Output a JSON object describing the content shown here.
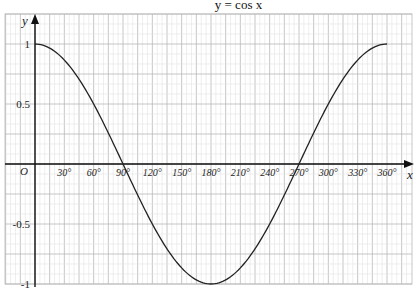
{
  "chart_data": {
    "type": "line",
    "title": "y = cos x",
    "xlabel": "x",
    "ylabel": "y",
    "origin_label": "O",
    "xlim": [
      0,
      360
    ],
    "ylim": [
      -1,
      1
    ],
    "grid": true,
    "x_ticks": [
      30,
      60,
      90,
      120,
      150,
      180,
      210,
      240,
      270,
      300,
      330,
      360
    ],
    "x_tick_labels": [
      "30°",
      "60°",
      "90°",
      "120°",
      "150°",
      "180°",
      "210°",
      "240°",
      "270°",
      "300°",
      "330°",
      "360°"
    ],
    "y_ticks": [
      1,
      0.5,
      -0.5,
      -1
    ],
    "y_tick_labels": [
      "1",
      "0.5",
      "-0.5",
      "-1"
    ],
    "series": [
      {
        "name": "y = cos x",
        "x": [
          0,
          30,
          60,
          90,
          120,
          150,
          180,
          210,
          240,
          270,
          300,
          330,
          360
        ],
        "values": [
          1,
          0.866,
          0.5,
          0,
          -0.5,
          -0.866,
          -1,
          -0.866,
          -0.5,
          0,
          0.5,
          0.866,
          1
        ]
      }
    ]
  },
  "colors": {
    "curve": "#222222",
    "axis": "#111111",
    "grid_major": "#b8b8b8",
    "grid_minor": "#e2e2e2"
  }
}
